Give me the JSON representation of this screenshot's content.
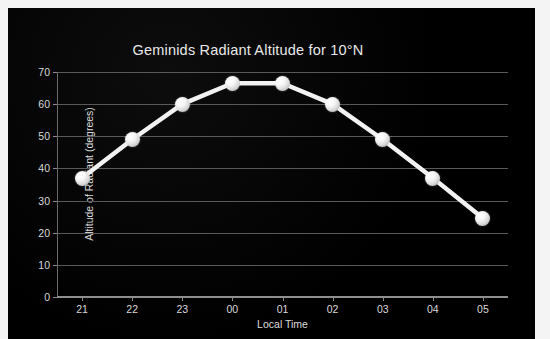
{
  "chart_data": {
    "type": "line",
    "title": "Geminids Radiant Altitude for 10°N",
    "xlabel": "Local Time",
    "ylabel": "Altitude of Radiant (degrees)",
    "categories": [
      "21",
      "22",
      "23",
      "00",
      "01",
      "02",
      "03",
      "04",
      "05"
    ],
    "values": [
      37,
      49,
      60,
      66.5,
      66.5,
      60,
      49,
      37,
      24.5
    ],
    "series": [
      {
        "name": "Altitude of Radiant",
        "values": [
          37,
          49,
          60,
          66.5,
          66.5,
          60,
          49,
          37,
          24.5
        ]
      }
    ],
    "ylim": [
      0,
      70
    ],
    "yticks": [
      0,
      10,
      20,
      30,
      40,
      50,
      60,
      70
    ],
    "ytick_labels": [
      "0",
      "10",
      "20",
      "30",
      "40",
      "50",
      "60",
      "70"
    ],
    "xtick_labels": [
      "21",
      "22",
      "23",
      "00",
      "01",
      "02",
      "03",
      "04",
      "05"
    ],
    "grid": "horizontal",
    "legend": "none",
    "line_color": "#f2f2f2",
    "marker_color": "#ffffff",
    "background_color": "#000000",
    "gridline_color": "#595959",
    "text_color": "#dcdcdc"
  }
}
